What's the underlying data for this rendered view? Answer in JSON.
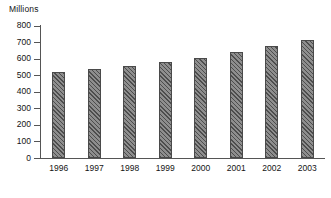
{
  "chart_data": {
    "type": "bar",
    "title": "",
    "subtitle": "",
    "xlabel": "",
    "ylabel": "Millions",
    "categories": [
      "1996",
      "1997",
      "1998",
      "1999",
      "2000",
      "2001",
      "2002",
      "2003"
    ],
    "values": [
      520,
      540,
      558,
      578,
      602,
      642,
      675,
      712
    ],
    "series": [
      {
        "name": "Millions",
        "values": [
          520,
          540,
          558,
          578,
          602,
          642,
          675,
          712
        ]
      }
    ],
    "ylim": [
      0,
      800
    ],
    "yticks": [
      0,
      100,
      200,
      300,
      400,
      500,
      600,
      700,
      800
    ],
    "ytick_labels": [
      "0",
      "100",
      "200",
      "300",
      "400",
      "500",
      "600",
      "700",
      "800"
    ],
    "grid": false,
    "legend": false,
    "legend_position": "none",
    "bar_color": "#6e6e6e",
    "bar_pattern": "diagonal-hatch",
    "axis_color": "#555555",
    "background_color": "#ffffff",
    "text_color": "#141414"
  }
}
